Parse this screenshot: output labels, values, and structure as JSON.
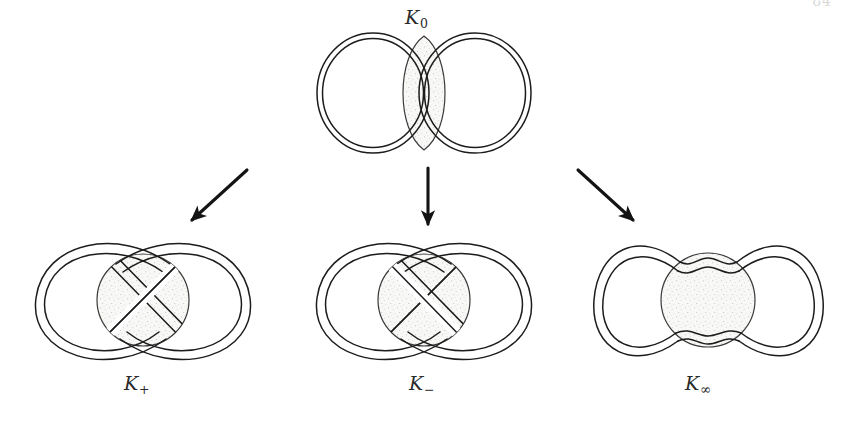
{
  "figure": {
    "kind": "knot-skein-diagram",
    "background_color": "#ffffff",
    "ink_color": "#1a1a1a",
    "shade_fill_color": "#f7f7f5",
    "shade_stipple_color": "#b9b5ad",
    "page_number": "84",
    "labels": {
      "k0": {
        "base": "K",
        "sub": "0"
      },
      "k_plus": {
        "base": "K",
        "sub": "+"
      },
      "k_minus": {
        "base": "K",
        "sub": "−"
      },
      "k_infinity": {
        "base": "K",
        "sub": "∞"
      }
    },
    "nodes": [
      {
        "id": "k0",
        "label": "K₀",
        "role": "parent-tangle",
        "description": "Two ribbon circles side by side overlapping at a vertical lens-shaped shaded region; the tangle site contains two vertical parallel strands.",
        "tangle_type": "0-tangle",
        "center": [
          424,
          93
        ]
      },
      {
        "id": "k_plus",
        "label": "K₊",
        "role": "child-tangle",
        "description": "Figure-eight ribbon with a single positive crossing inside the shaded disc.",
        "tangle_type": "positive-crossing",
        "center": [
          143,
          300
        ]
      },
      {
        "id": "k_minus",
        "label": "K₋",
        "role": "child-tangle",
        "description": "Figure-eight ribbon with a single negative crossing inside the shaded disc.",
        "tangle_type": "negative-crossing",
        "center": [
          424,
          300
        ]
      },
      {
        "id": "k_infinity",
        "label": "K∞",
        "role": "child-tangle",
        "description": "Two ribbon circles joined by horizontal strands that pass above and below the shaded disc.",
        "tangle_type": "infinity-tangle",
        "center": [
          708,
          300
        ]
      }
    ],
    "arrows": [
      {
        "id": "arrow-left",
        "from": "k0",
        "to": "k_plus",
        "x1": 247,
        "y1": 170,
        "x2": 190,
        "y2": 222,
        "direction": "down-left"
      },
      {
        "id": "arrow-middle",
        "from": "k0",
        "to": "k_minus",
        "x1": 428,
        "y1": 168,
        "x2": 428,
        "y2": 227,
        "direction": "down"
      },
      {
        "id": "arrow-right",
        "from": "k0",
        "to": "k_infinity",
        "x1": 578,
        "y1": 170,
        "x2": 635,
        "y2": 222,
        "direction": "down-right"
      }
    ]
  }
}
